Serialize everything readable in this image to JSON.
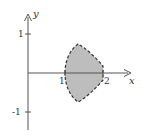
{
  "diagram": {
    "type": "shaded-region-plot",
    "axes": {
      "x_label": "x",
      "y_label": "y",
      "x_ticks": [
        {
          "value": 1,
          "label": "1"
        },
        {
          "value": 2,
          "label": "2"
        }
      ],
      "y_ticks": [
        {
          "value": 1,
          "label": "1"
        },
        {
          "value": -1,
          "label": "-1"
        }
      ]
    },
    "region": {
      "description": "Shaded region bounded by dashed curves, between x=1 and x=2, symmetric about the x-axis",
      "x_range": [
        1,
        2
      ],
      "y_range": [
        -0.75,
        0.75
      ],
      "fill_color": "#bdbdbd",
      "border_style": "dashed",
      "border_color": "#333333"
    },
    "colors": {
      "axis": "#555555",
      "fill": "#bdbdbd",
      "boundary": "#333333"
    }
  }
}
